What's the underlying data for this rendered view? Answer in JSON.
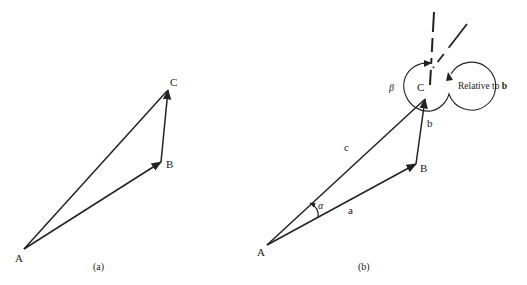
{
  "figure": {
    "panel_a": {
      "caption": "(a)",
      "points": {
        "A": {
          "label": "A"
        },
        "B": {
          "label": "B"
        },
        "C": {
          "label": "C"
        }
      }
    },
    "panel_b": {
      "caption": "(b)",
      "points": {
        "A": {
          "label": "A"
        },
        "B": {
          "label": "B"
        },
        "C": {
          "label": "C"
        }
      },
      "vectors": {
        "a": {
          "label": "a"
        },
        "b": {
          "label": "b"
        },
        "c": {
          "label": "c"
        }
      },
      "angles": {
        "alpha": {
          "label": "α"
        },
        "beta": {
          "label": "β"
        }
      },
      "annotation": {
        "relative_prefix": "Relative to ",
        "relative_vector": "b"
      }
    },
    "colors": {
      "ink": "#222222",
      "background": "#ffffff"
    }
  }
}
